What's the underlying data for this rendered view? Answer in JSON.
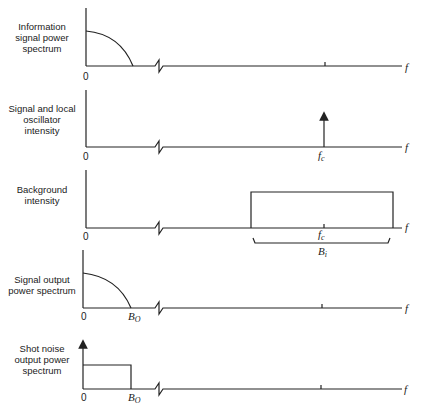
{
  "panels": [
    {
      "title_lines": [
        "Information",
        "signal power",
        "spectrum"
      ],
      "origin_label": "0",
      "axis_label": "f",
      "shape": "quarter-ellipse",
      "marks": []
    },
    {
      "title_lines": [
        "Signal and local",
        "oscillator",
        "intensity"
      ],
      "origin_label": "0",
      "axis_label": "f",
      "shape": "impulse",
      "marks": [
        "f_c"
      ],
      "center_label": "f",
      "center_sub": "c"
    },
    {
      "title_lines": [
        "Background",
        "intensity"
      ],
      "origin_label": "0",
      "axis_label": "f",
      "shape": "rectangle-band",
      "center_label": "f",
      "center_sub": "c",
      "bandwidth_label": "B",
      "bandwidth_sub": "i"
    },
    {
      "title_lines": [
        "Signal output",
        "power spectrum"
      ],
      "origin_label": "0",
      "axis_label": "f",
      "shape": "quarter-ellipse",
      "cutoff_label": "B",
      "cutoff_sub": "O"
    },
    {
      "title_lines": [
        "Shot noise",
        "output power",
        "spectrum"
      ],
      "origin_label": "0",
      "axis_label": "f",
      "shape": "rectangle-with-impulse-at-zero",
      "cutoff_label": "B",
      "cutoff_sub": "O"
    }
  ]
}
